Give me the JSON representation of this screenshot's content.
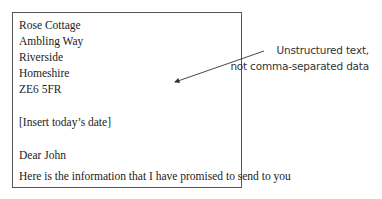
{
  "letter": {
    "address": [
      "Rose Cottage",
      "Ambling Way",
      "Riverside",
      "Homeshire",
      "ZE6 5FR"
    ],
    "date_placeholder": "[Insert today’s date]",
    "salutation": "Dear John",
    "body": "Here is the information that I have promised to send to you"
  },
  "annotation": {
    "line1": "Unstructured text,",
    "line2": "not comma-separated data"
  },
  "colors": {
    "border": "#555555",
    "text": "#222222",
    "arrow": "#333333"
  }
}
